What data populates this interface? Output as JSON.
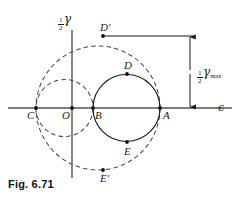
{
  "figure": {
    "caption": "Fig. 6.71",
    "background_color": "#ffffff",
    "ink_color": "#1a1a1a"
  },
  "axes": {
    "horizontal": {
      "label": "ϵ",
      "name": "normal-strain-axis",
      "y_pixel": 108,
      "x_start": 8,
      "x_end": 232
    },
    "vertical": {
      "label_fraction_numerator": "1",
      "label_fraction_denominator": "2",
      "label_symbol": "γ",
      "name": "half-shear-strain-axis",
      "x_pixel": 72,
      "y_start": 30,
      "y_end": 178
    }
  },
  "points": [
    {
      "id": "C",
      "label": "C",
      "x": 36,
      "y": 108,
      "label_dx": -4,
      "label_dy": 5,
      "on": "large-dashed-circle"
    },
    {
      "id": "O",
      "label": "O",
      "x": 72,
      "y": 108,
      "label_dx": -5,
      "label_dy": 5,
      "on": "origin"
    },
    {
      "id": "B",
      "label": "B",
      "x": 93,
      "y": 108,
      "label_dx": 2,
      "label_dy": 5,
      "on": "solid-circle"
    },
    {
      "id": "A",
      "label": "A",
      "x": 160,
      "y": 108,
      "label_dx": 3,
      "label_dy": 5,
      "on": "solid-circle"
    },
    {
      "id": "D",
      "label": "D",
      "x": 127,
      "y": 74,
      "label_dx": -3,
      "label_dy": -13,
      "on": "solid-circle"
    },
    {
      "id": "E",
      "label": "E",
      "x": 127,
      "y": 142,
      "label_dx": -3,
      "label_dy": 4,
      "on": "solid-circle"
    },
    {
      "id": "Dp",
      "label": "D′",
      "x": 103,
      "y": 36,
      "label_dx": -3,
      "label_dy": -13,
      "on": "large-dashed-circle"
    },
    {
      "id": "Ep",
      "label": "E′",
      "x": 103,
      "y": 170,
      "label_dx": -3,
      "label_dy": 3,
      "on": "large-dashed-circle"
    }
  ],
  "circles": [
    {
      "name": "large-dashed-circle",
      "style": "dashed",
      "center_x": 98,
      "center_y": 108,
      "radius": 62,
      "endpoints": [
        "C",
        "A"
      ],
      "description": "Principal circle through C and A"
    },
    {
      "name": "small-dashed-circle",
      "style": "dashed",
      "center_x": 64.5,
      "center_y": 108,
      "radius": 28.5,
      "endpoints": [
        "C",
        "B"
      ],
      "description": "Circle through C and B"
    },
    {
      "name": "solid-circle",
      "style": "solid",
      "center_x": 126.5,
      "center_y": 108,
      "radius": 33.5,
      "endpoints": [
        "B",
        "A"
      ],
      "description": "Circle through B and A"
    }
  ],
  "dimension": {
    "name": "half-gamma-max-dimension",
    "label_fraction_numerator": "1",
    "label_fraction_denominator": "2",
    "label_symbol": "γ",
    "label_subscript": "max",
    "arrow_x": 190,
    "arrow_top_y": 36,
    "arrow_bottom_y": 108,
    "leader_from_x": 104,
    "leader_to_x": 193,
    "leader_y": 36
  }
}
